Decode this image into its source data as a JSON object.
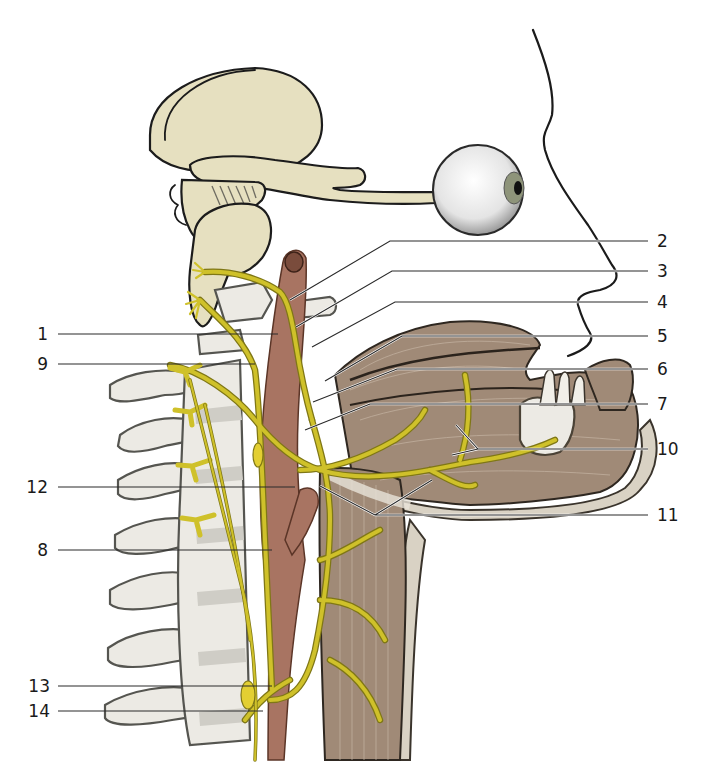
{
  "figure": {
    "colors": {
      "background": "#ffffff",
      "brain": "#e6e0c0",
      "nerve": "#cfc12a",
      "nerve_edge": "#7f7716",
      "bone": "#eceae4",
      "muscle": "#a08a77",
      "artery": "#a87462",
      "skin": "#d9d2c4",
      "label_text": "#1a1a1a",
      "leader_line": "#2a2a2a"
    },
    "labels_left": [
      {
        "id": "1",
        "text": "1",
        "y": 334
      },
      {
        "id": "9",
        "text": "9",
        "y": 364
      },
      {
        "id": "12",
        "text": "12",
        "y": 487
      },
      {
        "id": "8",
        "text": "8",
        "y": 550
      },
      {
        "id": "13",
        "text": "13",
        "y": 686
      },
      {
        "id": "14",
        "text": "14",
        "y": 711
      }
    ],
    "labels_right": [
      {
        "id": "2",
        "text": "2",
        "y": 241
      },
      {
        "id": "3",
        "text": "3",
        "y": 271
      },
      {
        "id": "4",
        "text": "4",
        "y": 302
      },
      {
        "id": "5",
        "text": "5",
        "y": 336
      },
      {
        "id": "6",
        "text": "6",
        "y": 369
      },
      {
        "id": "7",
        "text": "7",
        "y": 404
      },
      {
        "id": "10",
        "text": "10",
        "y": 449
      },
      {
        "id": "11",
        "text": "11",
        "y": 515
      }
    ]
  }
}
